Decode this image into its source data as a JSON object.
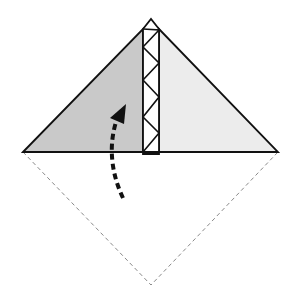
{
  "diagram": {
    "colors": {
      "background": "#ffffff",
      "left_flap": "#c9c9c9",
      "right_flap": "#ececec",
      "strip": "#ffffff",
      "outline": "#111111",
      "dashed_edge": "#8a8a8a",
      "arrow": "#111111"
    },
    "shapes": {
      "left_flap": "Shaded left triangle",
      "right_flap": "Light right triangle",
      "center_strip": "Narrow center strip with zigzag pleats",
      "hidden_lower_half": "Dashed lower diamond half (valley outline)",
      "fold_arrow": "Dashed curved arrow pointing upward"
    }
  }
}
